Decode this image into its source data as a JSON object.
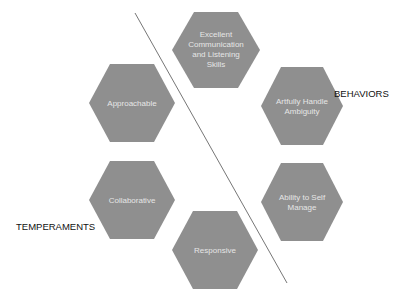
{
  "diagram": {
    "colors": {
      "hex_fill": "#8f8f8f",
      "hex_text": "#e6e6e6",
      "divider": "#666666",
      "label_text": "#111111"
    },
    "divider_line": {
      "x1": 135,
      "y1": 13,
      "x2": 287,
      "y2": 283
    },
    "groups": {
      "behaviors": {
        "label": "BEHAVIORS"
      },
      "temperaments": {
        "label": "TEMPERAMENTS"
      }
    },
    "hexagons": [
      {
        "id": "communication",
        "group": "behaviors",
        "lines": [
          "Excellent",
          "Communication",
          "and Listening",
          "Skills"
        ],
        "cx": 216,
        "cy": 50
      },
      {
        "id": "ambiguity",
        "group": "behaviors",
        "lines": [
          "Artfully Handle",
          "Ambiguity"
        ],
        "cx": 302,
        "cy": 106
      },
      {
        "id": "self-manage",
        "group": "behaviors",
        "lines": [
          "Ability to Self",
          "Manage"
        ],
        "cx": 302,
        "cy": 202
      },
      {
        "id": "approachable",
        "group": "temperaments",
        "lines": [
          "Approachable"
        ],
        "cx": 132,
        "cy": 103
      },
      {
        "id": "collaborative",
        "group": "temperaments",
        "lines": [
          "Collaborative"
        ],
        "cx": 132,
        "cy": 200
      },
      {
        "id": "responsive",
        "group": "temperaments",
        "lines": [
          "Responsive"
        ],
        "cx": 215,
        "cy": 250
      }
    ]
  }
}
